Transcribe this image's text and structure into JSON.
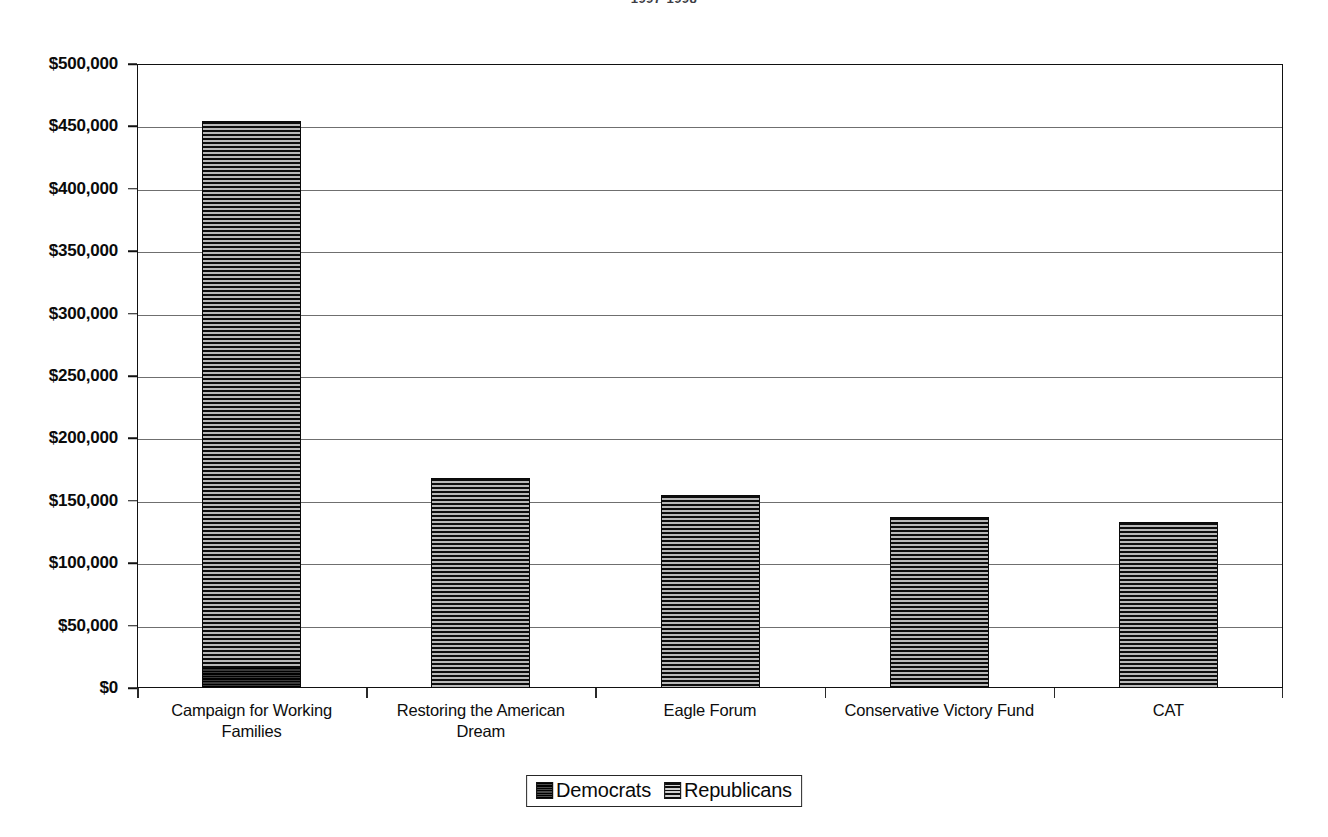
{
  "chart_data": {
    "type": "bar",
    "stacked": true,
    "title": "1997-1998",
    "xlabel": "",
    "ylabel": "",
    "ylim": [
      0,
      500000
    ],
    "ytick_step": 50000,
    "grid": true,
    "legend_position": "bottom",
    "categories": [
      "Campaign for Working Families",
      "Restoring the American Dream",
      "Eagle Forum",
      "Conservative Victory Fund",
      "CAT"
    ],
    "series": [
      {
        "name": "Democrats",
        "values": [
          17000,
          0,
          0,
          0,
          0
        ]
      },
      {
        "name": "Republicans",
        "values": [
          437000,
          168000,
          155000,
          137000,
          133000
        ]
      }
    ],
    "totals": [
      454000,
      168000,
      155000,
      137000,
      133000
    ],
    "ytick_labels": [
      "$500,000",
      "$450,000",
      "$400,000",
      "$350,000",
      "$300,000",
      "$250,000",
      "$200,000",
      "$150,000",
      "$100,000",
      "$50,000",
      "$0"
    ],
    "ytick_values": [
      500000,
      450000,
      400000,
      350000,
      300000,
      250000,
      200000,
      150000,
      100000,
      50000,
      0
    ],
    "category_label_lines": [
      [
        "Campaign for Working",
        "Families"
      ],
      [
        "Restoring the American",
        "Dream"
      ],
      [
        "Eagle Forum"
      ],
      [
        "Conservative Victory Fund"
      ],
      [
        "CAT"
      ]
    ],
    "colors": {
      "democrats": "#1a1a1a",
      "republicans": "#5d5d5d",
      "axis": "#111111",
      "gridline": "#6f6f6f",
      "background": "#ffffff"
    }
  },
  "legend": {
    "items": [
      {
        "label": "Democrats",
        "pattern": "solid-dark"
      },
      {
        "label": "Republicans",
        "pattern": "horizontal-stripes"
      }
    ]
  }
}
